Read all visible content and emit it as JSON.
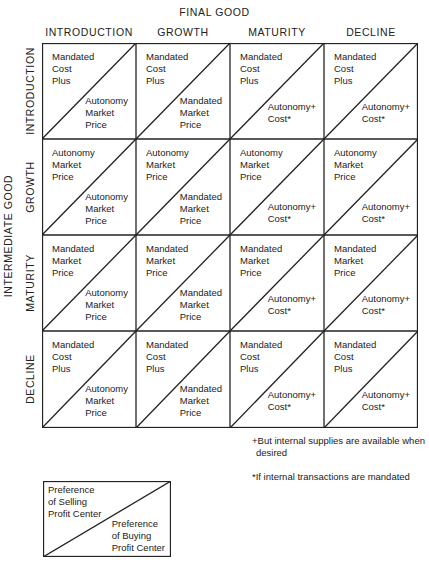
{
  "diagram": {
    "top_title": "FINAL GOOD",
    "side_title": "INTERMEDIATE GOOD",
    "columns": [
      "INTRODUCTION",
      "GROWTH",
      "MATURITY",
      "DECLINE"
    ],
    "rows": [
      "INTRODUCTION",
      "GROWTH",
      "MATURITY",
      "DECLINE"
    ],
    "cells": [
      [
        {
          "upper": [
            "Mandated",
            "Cost",
            "Plus"
          ],
          "lower": [
            "Autonomy",
            "Market",
            "Price"
          ]
        },
        {
          "upper": [
            "Mandated",
            "Cost",
            "Plus"
          ],
          "lower": [
            "Mandated",
            "Market",
            "Price"
          ]
        },
        {
          "upper": [
            "Mandated",
            "Cost",
            "Plus"
          ],
          "lower": [
            "Autonomy+",
            "Cost*"
          ]
        },
        {
          "upper": [
            "Mandated",
            "Cost",
            "Plus"
          ],
          "lower": [
            "Autonomy+",
            "Cost*"
          ]
        }
      ],
      [
        {
          "upper": [
            "Autonomy",
            "Market",
            "Price"
          ],
          "lower": [
            "Autonomy",
            "Market",
            "Price"
          ]
        },
        {
          "upper": [
            "Autonomy",
            "Market",
            "Price"
          ],
          "lower": [
            "Mandated",
            "Market",
            "Price"
          ]
        },
        {
          "upper": [
            "Autonomy",
            "Market",
            "Price"
          ],
          "lower": [
            "Autonomy+",
            "Cost*"
          ]
        },
        {
          "upper": [
            "Autonomy",
            "Market",
            "Price"
          ],
          "lower": [
            "Autonomy+",
            "Cost*"
          ]
        }
      ],
      [
        {
          "upper": [
            "Mandated",
            "Market",
            "Price"
          ],
          "lower": [
            "Autonomy",
            "Market",
            "Price"
          ]
        },
        {
          "upper": [
            "Mandated",
            "Market",
            "Price"
          ],
          "lower": [
            "Mandated",
            "Market",
            "Price"
          ]
        },
        {
          "upper": [
            "Mandated",
            "Market",
            "Price"
          ],
          "lower": [
            "Autonomy+",
            "Cost*"
          ]
        },
        {
          "upper": [
            "Mandated",
            "Market",
            "Price"
          ],
          "lower": [
            "Autonomy+",
            "Cost*"
          ]
        }
      ],
      [
        {
          "upper": [
            "Mandated",
            "Cost",
            "Plus"
          ],
          "lower": [
            "Autonomy",
            "Market",
            "Price"
          ]
        },
        {
          "upper": [
            "Mandated",
            "Cost",
            "Plus"
          ],
          "lower": [
            "Mandated",
            "Market",
            "Price"
          ]
        },
        {
          "upper": [
            "Mandated",
            "Cost",
            "Plus"
          ],
          "lower": [
            "Autonomy+",
            "Cost*"
          ]
        },
        {
          "upper": [
            "Mandated",
            "Cost",
            "Plus"
          ],
          "lower": [
            "Autonomy+",
            "Cost*"
          ]
        }
      ]
    ],
    "footnotes": {
      "plus": [
        "+But internal supplies are available when",
        "desired"
      ],
      "star": "*If internal transactions are mandated"
    },
    "legend": {
      "upper": [
        "Preference",
        "of Selling",
        "Profit Center"
      ],
      "lower": [
        "Preference",
        "of Buying",
        "Profit Center"
      ]
    }
  }
}
